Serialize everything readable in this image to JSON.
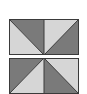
{
  "figure": {
    "colors": {
      "dark": "#7a7a7a",
      "light": "#d6d6d6",
      "line": "#3a3a3a"
    },
    "tiles": [
      {
        "name": "top-tile",
        "top": 19
      },
      {
        "name": "bottom-tile",
        "top": 58
      }
    ]
  }
}
